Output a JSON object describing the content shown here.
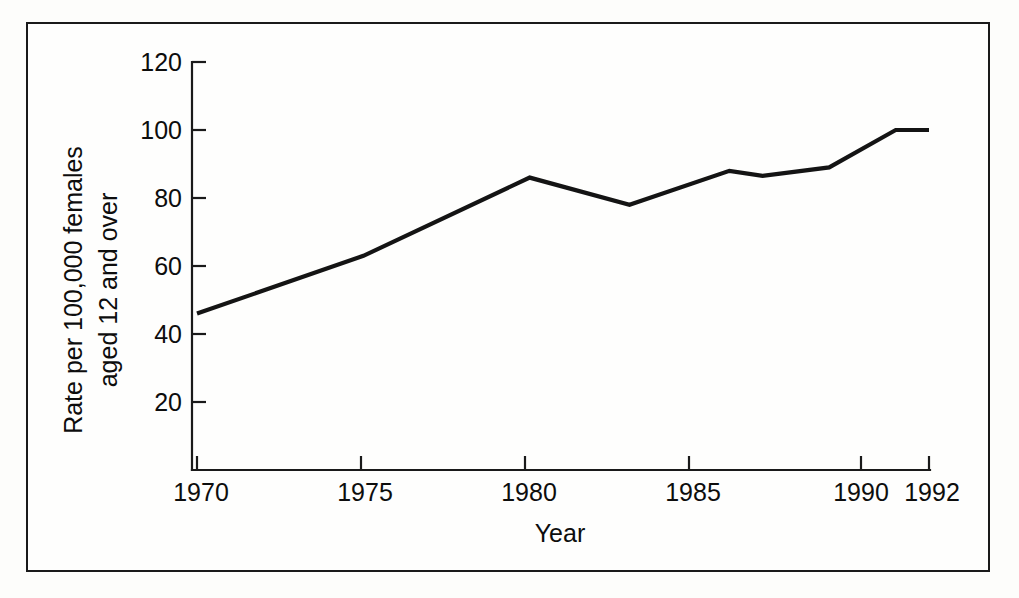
{
  "figure": {
    "border_color": "#1a1a1a",
    "background_color": "#fefefd",
    "line_color": "#141414"
  },
  "axes": {
    "y_title_line1": "Rate per 100,000 females",
    "y_title_line2": "aged 12 and over",
    "x_title": "Year",
    "y_ticks": [
      "120",
      "100",
      "80",
      "60",
      "40",
      "20"
    ],
    "x_ticks": [
      "1970",
      "1975",
      "1980",
      "1985",
      "1990",
      "1992"
    ]
  },
  "chart_data": {
    "type": "line",
    "title": "",
    "xlabel": "Year",
    "ylabel": "Rate per 100,000 females aged 12 and over",
    "xlim": [
      1970,
      1992
    ],
    "ylim": [
      0,
      120
    ],
    "xticks": [
      1970,
      1975,
      1980,
      1985,
      1990,
      1992
    ],
    "yticks": [
      20,
      40,
      60,
      80,
      100,
      120
    ],
    "grid": false,
    "legend": null,
    "series": [
      {
        "name": "Rate per 100,000 females aged 12 and over",
        "x": [
          1970,
          1975,
          1980,
          1983,
          1986,
          1987,
          1989,
          1991,
          1992
        ],
        "values": [
          46,
          63,
          86,
          78,
          88,
          86.5,
          89,
          100,
          100
        ]
      }
    ]
  }
}
